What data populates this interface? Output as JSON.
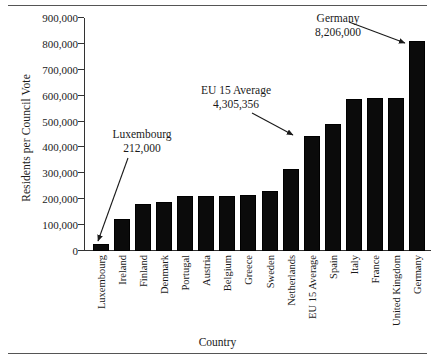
{
  "chart_data": {
    "type": "bar",
    "title": "",
    "xlabel": "Country",
    "ylabel": "Residents per Council Vote",
    "categories": [
      "Luxembourg",
      "Ireland",
      "Finland",
      "Denmark",
      "Portugal",
      "Austria",
      "Belgium",
      "Greece",
      "Sweden",
      "Netherlands",
      "EU 15 Average",
      "Spain",
      "Italy",
      "France",
      "United Kingdom",
      "Germany"
    ],
    "values": [
      29000,
      124000,
      181000,
      190000,
      212000,
      213000,
      213000,
      217000,
      231000,
      317000,
      446000,
      492000,
      586000,
      591000,
      591000,
      813000
    ],
    "ylim": [
      0,
      900000
    ],
    "ytick_labels": [
      "0",
      "100,000",
      "200,000",
      "300,000",
      "400,000",
      "500,000",
      "600,000",
      "700,000",
      "800,000",
      "900,000"
    ],
    "ytick_values": [
      0,
      100000,
      200000,
      300000,
      400000,
      500000,
      600000,
      700000,
      800000,
      900000
    ],
    "grid": false,
    "legend": "none",
    "bar_color": "#0b0b0b",
    "annotations": [
      {
        "name": "Luxembourg",
        "label": "Luxembourg",
        "value": "212,000",
        "target": "Luxembourg"
      },
      {
        "name": "EU 15 Average",
        "label": "EU 15 Average",
        "value": "4,305,356",
        "target": "EU 15 Average"
      },
      {
        "name": "Germany",
        "label": "Germany",
        "value": "8,206,000",
        "target": "Germany"
      }
    ]
  },
  "annotations": {
    "luxembourg": {
      "label": "Luxembourg",
      "value": "212,000"
    },
    "eu15": {
      "label": "EU 15 Average",
      "value": "4,305,356"
    },
    "germany": {
      "label": "Germany",
      "value": "8,206,000"
    }
  },
  "axes": {
    "y_title": "Residents per Council Vote",
    "x_title": "Country"
  }
}
